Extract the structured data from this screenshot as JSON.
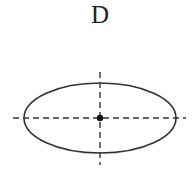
{
  "diagram": {
    "label": "D",
    "shape": "ellipse",
    "ellipse": {
      "cx": 100,
      "cy": 118,
      "rx": 76,
      "ry": 35
    },
    "axes": {
      "style": "dashed",
      "horizontal": {
        "x1": 13,
        "x2": 186,
        "y": 118
      },
      "vertical": {
        "x": 100,
        "y1": 72,
        "y2": 165
      }
    },
    "center_point": {
      "x": 100,
      "y": 118,
      "r": 3
    },
    "stroke_color": "#333333"
  }
}
